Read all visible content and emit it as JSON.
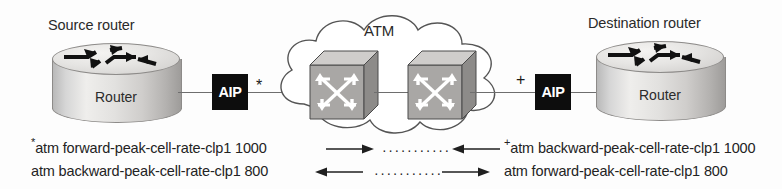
{
  "diagram": {
    "source_router": {
      "caption": "Source router",
      "device_label": "Router",
      "adapter": "AIP",
      "marker": "*"
    },
    "destination_router": {
      "caption": "Destination router",
      "device_label": "Router",
      "adapter": "AIP",
      "marker": "+"
    },
    "cloud": {
      "label": "ATM",
      "switches": [
        {
          "name": "atm-switch-1"
        },
        {
          "name": "atm-switch-2"
        }
      ]
    },
    "commands": [
      {
        "left_marker": "*",
        "left_text": "atm forward-peak-cell-rate-clp1 1000",
        "left_arrow": "right",
        "dots": "···········",
        "right_arrow": "left",
        "right_marker": "+",
        "right_text": "atm backward-peak-cell-rate-clp1 1000"
      },
      {
        "left_marker": "",
        "left_text": "atm backward-peak-cell-rate-clp1 800",
        "left_arrow": "left",
        "dots": "···········",
        "right_arrow": "right",
        "right_marker": "",
        "right_text": "atm forward-peak-cell-rate-clp1 800"
      }
    ]
  },
  "colors": {
    "background": "#fdfdfd",
    "line": "#6e6e6e",
    "text": "#232323",
    "adapter_fill": "#0d0d0d",
    "adapter_text": "#ffffff",
    "device_body": "#d9d7d5"
  }
}
